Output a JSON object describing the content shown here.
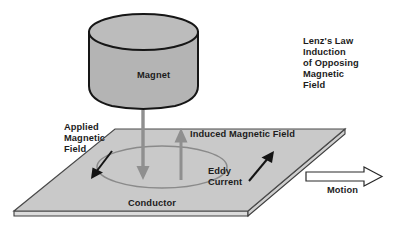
{
  "diagram": {
    "title_text": "Lenz's Law Induction of Opposing Magnetic Field",
    "labels": {
      "lenz_law": "Lenz's Law\nInduction\nof Opposing\nMagnetic\nField",
      "magnet": "Magnet",
      "applied_field": "Applied\nMagnetic\nField",
      "induced_field": "Induced Magnetic Field",
      "eddy_current": "Eddy\nCurrent",
      "conductor": "Conductor",
      "motion": "Motion"
    },
    "colors": {
      "background": "#ffffff",
      "magnet_fill": "#b3b3b3",
      "magnet_top_fill": "#b8b8b8",
      "magnet_outline": "#1a1a1a",
      "plate_fill": "#c8c8c8",
      "plate_edge_fill": "#d6d6d6",
      "plate_outline": "#4a4a4a",
      "field_arrow": "#8c8c8c",
      "eddy_loop": "#8a8a8a",
      "current_arrow": "#151515",
      "motion_arrow_outline": "#2a2a2a",
      "motion_arrow_fill": "#ffffff",
      "text": "#1c1c1c"
    },
    "elements": {
      "magnet_shape": "cylinder",
      "conductor_shape": "parallelogram-plate",
      "applied_field_arrow_direction": "down",
      "induced_field_arrow_direction": "up",
      "eddy_current_loop_shape": "ellipse",
      "current_arrow_left_direction": "down-left",
      "current_arrow_right_direction": "up-right",
      "motion_arrow_direction": "right",
      "motion_arrow_style": "hollow-block"
    }
  }
}
